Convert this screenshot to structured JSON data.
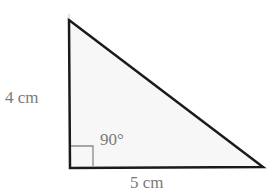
{
  "diagram": {
    "type": "right-triangle",
    "fill_color": "#f7f7f7",
    "stroke_color": "#1a1a1a",
    "marker_color": "#8a8a8a",
    "label_color": "#7a7a7a",
    "vertices": {
      "top": [
        69,
        20
      ],
      "bottom_left": [
        70,
        168
      ],
      "bottom_right": [
        263,
        167
      ]
    },
    "labels": {
      "left_side": "4 cm",
      "bottom_side": "5 cm",
      "right_angle": "90°"
    }
  }
}
